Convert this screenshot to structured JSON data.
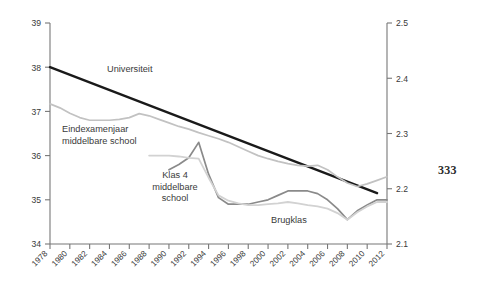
{
  "page": {
    "number": "333"
  },
  "chart_data": {
    "type": "line",
    "title": "",
    "subtitle": "",
    "xlabel": "",
    "ylabel": "",
    "grid": false,
    "legend_position": "inline-annotations",
    "x": [
      1978,
      1979,
      1980,
      1981,
      1982,
      1983,
      1984,
      1985,
      1986,
      1987,
      1988,
      1989,
      1990,
      1991,
      1992,
      1993,
      1994,
      1995,
      1996,
      1997,
      1998,
      1999,
      2000,
      2001,
      2002,
      2003,
      2004,
      2005,
      2006,
      2007,
      2008,
      2009,
      2010,
      2011,
      2012
    ],
    "xtick_labels": [
      "1978",
      "1980",
      "1982",
      "1984",
      "1986",
      "1988",
      "1990",
      "1992",
      "1994",
      "1996",
      "1998",
      "2000",
      "2002",
      "2004",
      "2006",
      "2008",
      "2010",
      "2012"
    ],
    "xlim": [
      1978,
      2012
    ],
    "left_axis": {
      "ylim": [
        34,
        39
      ],
      "ytick_labels": [
        "34",
        "35",
        "36",
        "37",
        "38",
        "39"
      ],
      "ytick_values": [
        34,
        35,
        36,
        37,
        38,
        39
      ]
    },
    "right_axis": {
      "ylim": [
        2.1,
        2.5
      ],
      "ytick_labels": [
        "2.1",
        "2.2",
        "2.3",
        "2.4",
        "2.5"
      ],
      "ytick_values": [
        2.1,
        2.2,
        2.3,
        2.4,
        2.5
      ]
    },
    "series": [
      {
        "name": "Universiteit",
        "label": "Universiteit",
        "color": "#1a1a1a",
        "width": 2.4,
        "axis": "left",
        "x": [
          1978,
          2011
        ],
        "values": [
          38.0,
          35.15
        ]
      },
      {
        "name": "Eindexamenjaar middelbare school",
        "label": "Eindexamenjaar\nmiddelbare school",
        "color": "#c2c2c2",
        "width": 1.7,
        "axis": "left",
        "x": [
          1978,
          1979,
          1980,
          1981,
          1982,
          1983,
          1984,
          1985,
          1986,
          1987,
          1988,
          1989,
          1990,
          1991,
          1992,
          1993,
          1994,
          1995,
          1996,
          1997,
          1998,
          1999,
          2000,
          2001,
          2002,
          2003,
          2004,
          2005,
          2006,
          2007,
          2008,
          2009,
          2010,
          2011,
          2012
        ],
        "values": [
          37.17,
          37.08,
          36.96,
          36.86,
          36.8,
          36.8,
          36.8,
          36.82,
          36.86,
          36.95,
          36.9,
          36.82,
          36.74,
          36.66,
          36.6,
          36.52,
          36.45,
          36.38,
          36.3,
          36.2,
          36.1,
          36.0,
          35.93,
          35.87,
          35.82,
          35.78,
          35.76,
          35.78,
          35.68,
          35.52,
          35.38,
          35.3,
          35.36,
          35.44,
          35.52
        ]
      },
      {
        "name": "Klas 4 middelbare school",
        "label": "Klas 4\nmiddelbare\nschool",
        "color": "#8a8a8a",
        "width": 1.7,
        "axis": "left",
        "x": [
          1990,
          1991,
          1992,
          1993,
          1994,
          1995,
          1996,
          1997,
          1998,
          1999,
          2000,
          2001,
          2002,
          2003,
          2004,
          2005,
          2006,
          2007,
          2008,
          2009,
          2010,
          2011,
          2012
        ],
        "values": [
          35.68,
          35.8,
          35.95,
          36.3,
          35.58,
          35.05,
          34.9,
          34.9,
          34.9,
          34.95,
          35.0,
          35.1,
          35.2,
          35.2,
          35.2,
          35.14,
          35.0,
          34.8,
          34.55,
          34.75,
          34.88,
          35.0,
          35.0
        ]
      },
      {
        "name": "Brugklas",
        "label": "Brugklas",
        "color": "#d2d2d2",
        "width": 1.8,
        "axis": "left",
        "x": [
          1988,
          1989,
          1990,
          1991,
          1992,
          1993,
          1994,
          1995,
          1996,
          1997,
          1998,
          1999,
          2000,
          2001,
          2002,
          2003,
          2004,
          2005,
          2006,
          2007,
          2008,
          2009,
          2010,
          2011,
          2012
        ],
        "values": [
          36.0,
          36.0,
          36.0,
          35.98,
          35.95,
          35.93,
          35.5,
          35.1,
          34.98,
          34.92,
          34.88,
          34.88,
          34.9,
          34.92,
          34.95,
          34.92,
          34.88,
          34.85,
          34.8,
          34.7,
          34.55,
          34.72,
          34.85,
          34.95,
          34.95
        ]
      }
    ]
  }
}
